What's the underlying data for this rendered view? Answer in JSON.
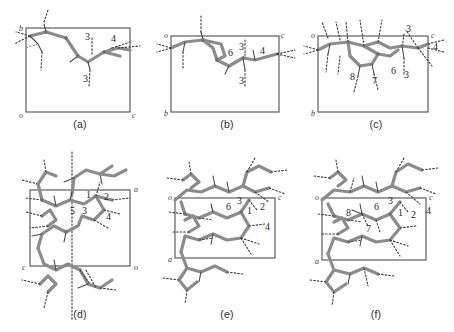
{
  "figure": {
    "type": "crystal-packing-diagram-grid",
    "rows": 2,
    "columns": 3,
    "background_color": "#ffffff",
    "bond_color": "#8c8c8c",
    "cell_edge_color": "#5e5e5e",
    "hbond_color": "#3d3d3d"
  },
  "panels": [
    {
      "id": "a",
      "caption": "(a)",
      "axis_labels": [
        {
          "text": "b",
          "position": "top-left"
        },
        {
          "text": "o",
          "position": "bottom-left"
        },
        {
          "text": "c",
          "position": "bottom-right"
        }
      ],
      "ring_labels": [
        {
          "text": "3",
          "position": "upper-middle"
        },
        {
          "text": "4",
          "position": "upper-right"
        },
        {
          "text": "3",
          "position": "lower-middle"
        }
      ]
    },
    {
      "id": "b",
      "caption": "(b)",
      "axis_labels": [
        {
          "text": "o",
          "position": "top-left"
        },
        {
          "text": "c",
          "position": "top-right"
        },
        {
          "text": "b",
          "position": "bottom-left"
        }
      ],
      "ring_labels": [
        {
          "text": "3",
          "position": "upper-right"
        },
        {
          "text": "4",
          "position": "right"
        },
        {
          "text": "6",
          "position": "middle"
        },
        {
          "text": "3",
          "position": "lower-middle"
        }
      ]
    },
    {
      "id": "c",
      "caption": "(c)",
      "axis_labels": [
        {
          "text": "o",
          "position": "top-left"
        },
        {
          "text": "c",
          "position": "top-right"
        },
        {
          "text": "b",
          "position": "bottom-left"
        }
      ],
      "ring_labels": [
        {
          "text": "3",
          "position": "top-right"
        },
        {
          "text": "4",
          "position": "right"
        },
        {
          "text": "8",
          "position": "lower-left"
        },
        {
          "text": "7",
          "position": "lower-middle"
        },
        {
          "text": "6",
          "position": "lower-right"
        },
        {
          "text": "3",
          "position": "lower-right-inner"
        }
      ]
    },
    {
      "id": "d",
      "caption": "(d)",
      "axis_labels": [
        {
          "text": "a",
          "position": "top-right"
        },
        {
          "text": "o",
          "position": "bottom-right"
        },
        {
          "text": "c",
          "position": "bottom-left"
        }
      ],
      "ring_labels": [
        {
          "text": "1",
          "position": "upper-middle"
        },
        {
          "text": "2",
          "position": "upper-right"
        },
        {
          "text": "5",
          "position": "middle-left"
        },
        {
          "text": "3",
          "position": "middle"
        },
        {
          "text": "4",
          "position": "middle-right"
        }
      ]
    },
    {
      "id": "e",
      "caption": "(e)",
      "axis_labels": [
        {
          "text": "o",
          "position": "top-left"
        },
        {
          "text": "c",
          "position": "top-right"
        },
        {
          "text": "a",
          "position": "bottom-left"
        }
      ],
      "ring_labels": [
        {
          "text": "6",
          "position": "upper-middle"
        },
        {
          "text": "3",
          "position": "upper-middle-right"
        },
        {
          "text": "1",
          "position": "upper-right"
        },
        {
          "text": "2",
          "position": "right"
        },
        {
          "text": "4",
          "position": "middle-right"
        }
      ]
    },
    {
      "id": "f",
      "caption": "(f)",
      "axis_labels": [
        {
          "text": "o",
          "position": "top-left"
        },
        {
          "text": "c",
          "position": "top-right"
        },
        {
          "text": "a",
          "position": "bottom-left"
        }
      ],
      "ring_labels": [
        {
          "text": "3",
          "position": "upper-middle-right"
        },
        {
          "text": "6",
          "position": "upper-middle"
        },
        {
          "text": "1",
          "position": "upper-right"
        },
        {
          "text": "2",
          "position": "right"
        },
        {
          "text": "4",
          "position": "far-right"
        },
        {
          "text": "8",
          "position": "middle-left"
        },
        {
          "text": "7",
          "position": "lower-middle"
        }
      ]
    }
  ]
}
